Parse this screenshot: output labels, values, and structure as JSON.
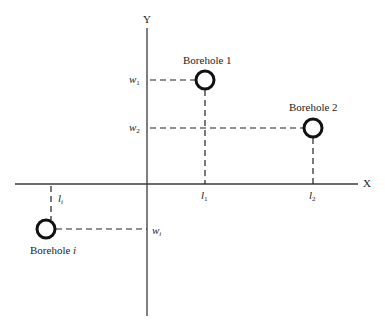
{
  "diagram": {
    "axes": {
      "x_label": "X",
      "y_label": "Y"
    },
    "boreholes": [
      {
        "name": "Borehole 1",
        "l_label": "l",
        "l_sub": "1",
        "w_label": "w",
        "w_sub": "1"
      },
      {
        "name": "Borehole 2",
        "l_label": "l",
        "l_sub": "2",
        "w_label": "w",
        "w_sub": "2"
      },
      {
        "name_prefix": "Borehole ",
        "name_suffix": "i",
        "l_label": "l",
        "l_sub": "i",
        "w_label": "w",
        "w_sub": "i"
      }
    ],
    "colors": {
      "line": "#3a3a3a",
      "circle": "#111111",
      "dash": "#222222"
    }
  }
}
